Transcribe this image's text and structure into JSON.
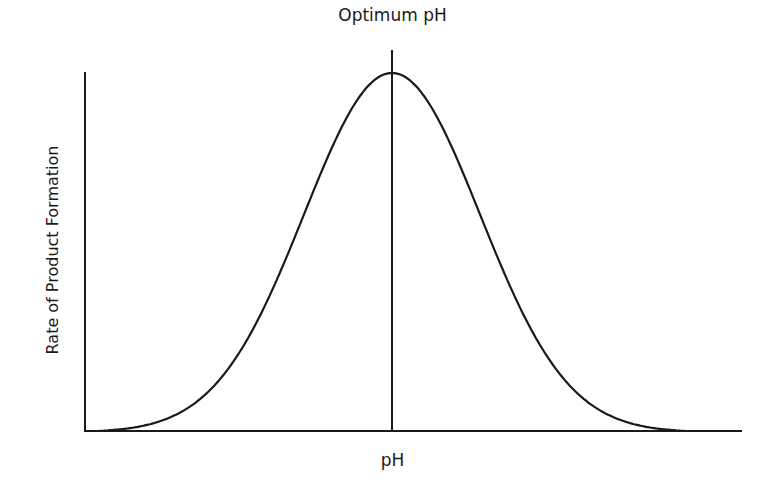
{
  "chart_data": {
    "type": "line",
    "title": "Optimum pH",
    "xlabel": "pH",
    "ylabel": "Rate of Product Formation",
    "grid": false,
    "legend": null,
    "annotations": [
      {
        "type": "vertical-line",
        "label": "Optimum pH",
        "x": 0.5
      }
    ],
    "series": [
      {
        "name": "rate",
        "shape": "bell curve (symmetric, peak at optimum pH)",
        "x": [
          0.0,
          0.1,
          0.2,
          0.3,
          0.4,
          0.5,
          0.6,
          0.7,
          0.8,
          0.9,
          1.0
        ],
        "values": [
          0.0,
          0.05,
          0.18,
          0.45,
          0.85,
          1.0,
          0.85,
          0.45,
          0.18,
          0.05,
          0.0
        ]
      }
    ],
    "xlim": [
      0,
      1
    ],
    "ylim": [
      0,
      1
    ],
    "ticks": "none"
  },
  "colors": {
    "line": "#1a1a1a",
    "background": "#ffffff"
  }
}
